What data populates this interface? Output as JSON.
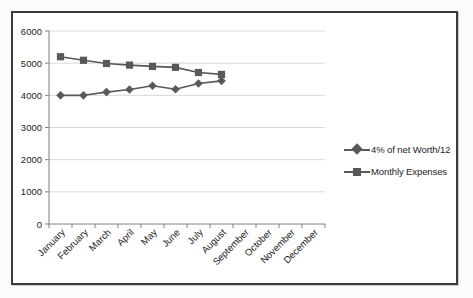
{
  "chart_data": {
    "type": "line",
    "title": "",
    "subtitle": "",
    "xlabel": "",
    "ylabel": "",
    "categories": [
      "January",
      "February",
      "March",
      "April",
      "May",
      "June",
      "July",
      "August",
      "September",
      "October",
      "November",
      "December"
    ],
    "ytick_labels": [
      "0",
      "1000",
      "2000",
      "3000",
      "4000",
      "5000",
      "6000"
    ],
    "ytick_values": [
      0,
      1000,
      2000,
      3000,
      4000,
      5000,
      6000
    ],
    "ylim": [
      0,
      6000
    ],
    "grid": "horizontal",
    "legend_position": "right",
    "series": [
      {
        "name": "4% of net Worth/12",
        "marker": "diamond",
        "color": "#595959",
        "values": [
          4000,
          4000,
          4100,
          4180,
          4300,
          4190,
          4370,
          4450,
          null,
          null,
          null,
          null
        ]
      },
      {
        "name": "Monthly Expenses",
        "marker": "square",
        "color": "#595959",
        "values": [
          5200,
          5090,
          4990,
          4940,
          4900,
          4870,
          4710,
          4650,
          null,
          null,
          null,
          null
        ]
      }
    ]
  },
  "legend": {
    "items": [
      {
        "label": "4% of net Worth/12",
        "marker": "diamond-marker-icon"
      },
      {
        "label": "Monthly Expenses",
        "marker": "square-marker-icon"
      }
    ]
  },
  "colors": {
    "series": "#595959",
    "gridline": "#d9d9d9",
    "axis": "#808080",
    "frame": "#3a3a3a",
    "text": "#1d1d1d",
    "background": "#ffffff"
  }
}
